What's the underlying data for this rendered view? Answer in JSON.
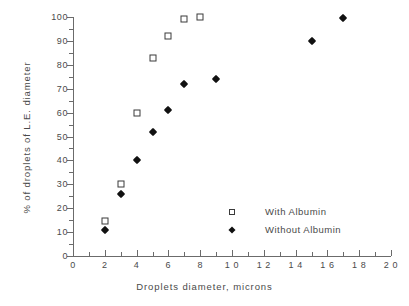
{
  "chart_data": {
    "type": "scatter",
    "title": "",
    "xlabel": "Droplets  diameter,  microns",
    "ylabel": "%  of  droplets  of  L.E.  diameter",
    "xlim": [
      0,
      20
    ],
    "ylim": [
      0,
      100
    ],
    "xticks": [
      0,
      2,
      4,
      6,
      8,
      10,
      12,
      14,
      16,
      18,
      20
    ],
    "xtick_labels": [
      "0",
      "2",
      "4",
      "6",
      "8",
      "1 0",
      "1 2",
      "1 4",
      "1 6",
      "1 8",
      "2 0"
    ],
    "yticks": [
      0,
      10,
      20,
      30,
      40,
      50,
      60,
      70,
      80,
      90,
      100
    ],
    "ytick_labels": [
      "0",
      "10",
      "20",
      "30",
      "40",
      "50",
      "60",
      "70",
      "80",
      "90",
      "100"
    ],
    "x_minor_step": 1,
    "y_minor_step": 5,
    "grid": false,
    "legend_position": "lower-right",
    "series": [
      {
        "name": "With Albumin",
        "marker": "open-square",
        "color": "#3a3a3a",
        "points": [
          {
            "x": 2,
            "y": 14.5
          },
          {
            "x": 3,
            "y": 30
          },
          {
            "x": 4,
            "y": 60
          },
          {
            "x": 5,
            "y": 83
          },
          {
            "x": 6,
            "y": 92
          },
          {
            "x": 7,
            "y": 99
          },
          {
            "x": 8,
            "y": 100
          }
        ]
      },
      {
        "name": "Without Albumin",
        "marker": "filled-diamond",
        "color": "#111111",
        "points": [
          {
            "x": 2,
            "y": 11
          },
          {
            "x": 3,
            "y": 26
          },
          {
            "x": 4,
            "y": 40
          },
          {
            "x": 5,
            "y": 52
          },
          {
            "x": 6,
            "y": 61
          },
          {
            "x": 7,
            "y": 72
          },
          {
            "x": 9,
            "y": 74
          },
          {
            "x": 15,
            "y": 90
          },
          {
            "x": 17,
            "y": 99.5
          }
        ]
      }
    ]
  },
  "legend": {
    "entries": [
      {
        "label": "With Albumin",
        "marker": "open-square"
      },
      {
        "label": "Without Albumin",
        "marker": "filled-diamond"
      }
    ]
  }
}
